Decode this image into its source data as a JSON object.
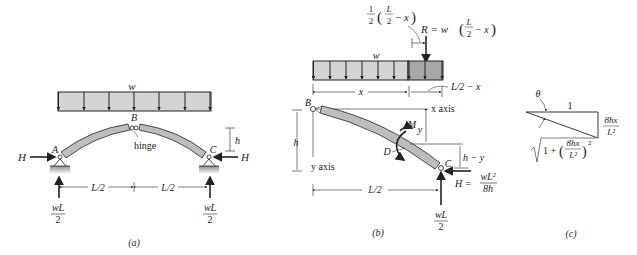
{
  "figure": {
    "panel_a": {
      "caption": "(a)",
      "load_label": "w",
      "point_labels": {
        "A": "A",
        "B": "B",
        "C": "C"
      },
      "hinge_label": "hinge",
      "height_label": "h",
      "thrust_left": "H",
      "thrust_right": "H",
      "span_left": "L/2",
      "span_right": "L/2",
      "reaction_left": {
        "num": "wL",
        "den": "2"
      },
      "reaction_right": {
        "num": "wL",
        "den": "2"
      }
    },
    "panel_b": {
      "caption": "(b)",
      "resultant_offset": {
        "coef_num": "1",
        "coef_den": "2",
        "inner": "L",
        "inner_den": "2",
        "tail": "− x"
      },
      "resultant": "R = w",
      "resultant_tail": "− x",
      "load_label": "w",
      "x_dim": "x",
      "remaining_dim": "L/2 − x",
      "x_axis": "x axis",
      "y_axis": "y axis",
      "point_B": "B",
      "point_C": "C",
      "point_D": "D",
      "moment": "M",
      "y_dim": "y",
      "h_dim": "h",
      "h_minus_y": "h − y",
      "span": "L/2",
      "thrust": {
        "lhs": "H =",
        "num": "wL²",
        "den": "8h"
      },
      "reaction": {
        "num": "wL",
        "den": "2"
      }
    },
    "panel_c": {
      "caption": "(c)",
      "angle": "θ",
      "adjacent": "1",
      "opposite": {
        "num": "8hx",
        "den": "L²"
      },
      "hypotenuse": {
        "prefix": "1 +",
        "num": "8hx",
        "den": "L²",
        "exp": "2"
      }
    }
  },
  "colors": {
    "member_fill": "#bdbdbd",
    "load_fill": "#d4d4d4",
    "load_dark": "#a8a8a8",
    "ground": "#9a9a9a",
    "line": "#222222"
  }
}
